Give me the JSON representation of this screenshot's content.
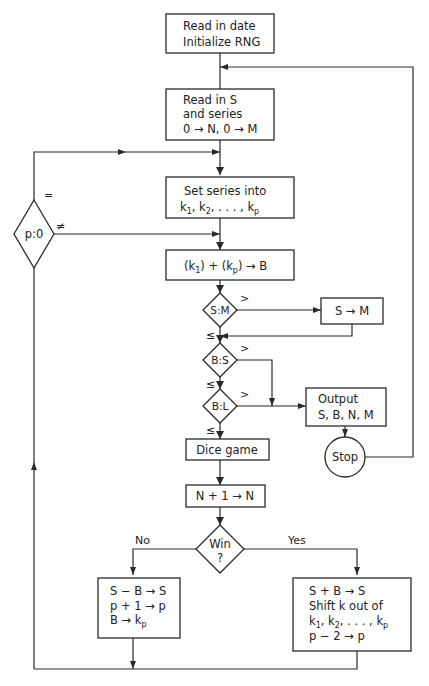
{
  "diagram": {
    "type": "flowchart",
    "nodes": {
      "start": {
        "lines": [
          "Read in date",
          "Initialize RNG"
        ]
      },
      "read": {
        "lines": [
          "Read in S",
          "and series",
          "0 → N, 0 → M"
        ]
      },
      "set_series": {
        "line1": "Set series into",
        "line2_parts": [
          "k",
          "1",
          ", k",
          "2",
          ",  . . .  , k",
          "p"
        ]
      },
      "bet": {
        "parts": [
          "(k",
          "1",
          ") + (k",
          "p",
          ")  →  B"
        ]
      },
      "p_test": {
        "label": "p:0",
        "eq": "=",
        "ne": "≠"
      },
      "s_m": {
        "label": "S:M",
        "gt": ">",
        "le": "≤"
      },
      "s_to_m": {
        "label": "S → M"
      },
      "b_s": {
        "label": "B:S",
        "gt": ">",
        "le": "≤"
      },
      "b_l": {
        "label": "B:L",
        "gt": ">",
        "le": "≤"
      },
      "output": {
        "lines": [
          "Output",
          "S, B, N, M"
        ]
      },
      "stop": {
        "label": "Stop"
      },
      "dice": {
        "label": "Dice game"
      },
      "incr": {
        "label": "N + 1  →  N"
      },
      "win": {
        "line1": "Win",
        "line2": "?",
        "no": "No",
        "yes": "Yes"
      },
      "lose_box": {
        "line1": "S − B  → S",
        "line2": "p + 1  → p",
        "line3_parts": [
          "B → k",
          "p"
        ]
      },
      "win_box": {
        "line1": "S + B  →  S",
        "line2": "Shift k out of",
        "line3_parts": [
          "k",
          "1",
          ", k",
          "2",
          ",  . . .  , k",
          "p"
        ],
        "line4": "p − 2  →  p"
      }
    }
  }
}
